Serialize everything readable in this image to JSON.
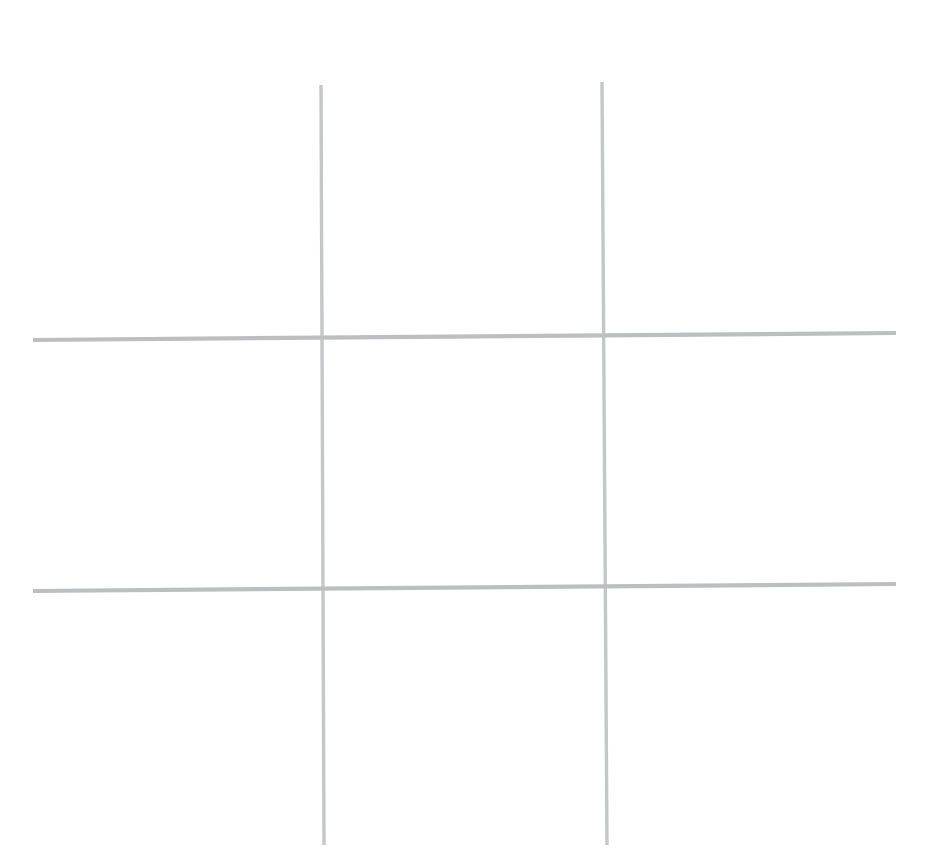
{
  "scene": {
    "title": "Tic-Tac-Toe Grid",
    "description": "Hand-drawn empty tic-tac-toe (noughts and crosses) grid on white paper",
    "background_color": "#ffffff",
    "width": 944,
    "height": 861
  },
  "grid": {
    "stroke_color": "#c2c4c6",
    "stroke_color_dark": "#b4b6b8",
    "stroke_width": 4,
    "rows": 3,
    "columns": 3,
    "lines": [
      {
        "id": "vertical-left",
        "orientation": "vertical",
        "x1": 321,
        "y1": 85,
        "x2": 324,
        "y2": 845,
        "width": 3.4,
        "color": "#c4c6c8"
      },
      {
        "id": "vertical-right",
        "orientation": "vertical",
        "x1": 602,
        "y1": 82,
        "x2": 607,
        "y2": 845,
        "width": 3.4,
        "color": "#c4c6c8"
      },
      {
        "id": "horizontal-top",
        "orientation": "horizontal",
        "x1": 33,
        "y1": 340,
        "x2": 896,
        "y2": 333,
        "width": 4.2,
        "color": "#bcbec0"
      },
      {
        "id": "horizontal-bottom",
        "orientation": "horizontal",
        "x1": 33,
        "y1": 591,
        "x2": 896,
        "y2": 584,
        "width": 4.2,
        "color": "#bcbec0"
      }
    ],
    "intersections": [
      {
        "id": "top-left-cross",
        "x": 322,
        "y": 338
      },
      {
        "id": "top-right-cross",
        "x": 605,
        "y": 336
      },
      {
        "id": "bottom-left-cross",
        "x": 323,
        "y": 589
      },
      {
        "id": "bottom-right-cross",
        "x": 606,
        "y": 587
      }
    ]
  },
  "cells": [
    {
      "id": "cell-0-0",
      "row": 0,
      "col": 0,
      "name": "top-left",
      "mark": ""
    },
    {
      "id": "cell-0-1",
      "row": 0,
      "col": 1,
      "name": "top-center",
      "mark": ""
    },
    {
      "id": "cell-0-2",
      "row": 0,
      "col": 2,
      "name": "top-right",
      "mark": ""
    },
    {
      "id": "cell-1-0",
      "row": 1,
      "col": 0,
      "name": "middle-left",
      "mark": ""
    },
    {
      "id": "cell-1-1",
      "row": 1,
      "col": 1,
      "name": "center",
      "mark": ""
    },
    {
      "id": "cell-1-2",
      "row": 1,
      "col": 2,
      "name": "middle-right",
      "mark": ""
    },
    {
      "id": "cell-2-0",
      "row": 2,
      "col": 0,
      "name": "bottom-left",
      "mark": ""
    },
    {
      "id": "cell-2-1",
      "row": 2,
      "col": 1,
      "name": "bottom-center",
      "mark": ""
    },
    {
      "id": "cell-2-2",
      "row": 2,
      "col": 2,
      "name": "bottom-right",
      "mark": ""
    }
  ],
  "cell_bounds": [
    {
      "left": 0,
      "top": 0,
      "width": 322,
      "height": 339
    },
    {
      "left": 322,
      "top": 0,
      "width": 284,
      "height": 338
    },
    {
      "left": 606,
      "top": 0,
      "width": 338,
      "height": 337
    },
    {
      "left": 0,
      "top": 339,
      "width": 322,
      "height": 251
    },
    {
      "left": 322,
      "top": 338,
      "width": 284,
      "height": 251
    },
    {
      "left": 606,
      "top": 337,
      "width": 338,
      "height": 251
    },
    {
      "left": 0,
      "top": 590,
      "width": 322,
      "height": 271
    },
    {
      "left": 322,
      "top": 589,
      "width": 284,
      "height": 272
    },
    {
      "left": 606,
      "top": 588,
      "width": 338,
      "height": 273
    }
  ]
}
